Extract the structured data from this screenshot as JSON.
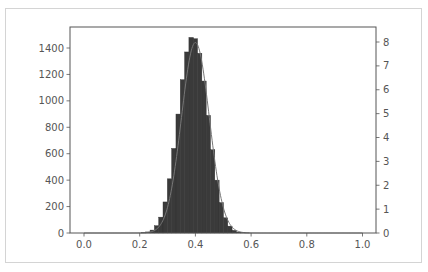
{
  "chart_data": {
    "type": "bar",
    "subtype": "histogram_with_density",
    "title": "",
    "xlabel": "",
    "ylabel": "",
    "ylabel_right": "",
    "xlim": [
      -0.05,
      1.05
    ],
    "ylim": [
      0,
      1550
    ],
    "ylim_right": [
      0,
      8.4
    ],
    "x_ticks": [
      "0.0",
      "0.2",
      "0.4",
      "0.6",
      "0.8",
      "1.0"
    ],
    "x_tick_values": [
      0.0,
      0.2,
      0.4,
      0.6,
      0.8,
      1.0
    ],
    "y_ticks_left": [
      "0",
      "200",
      "400",
      "600",
      "800",
      "1000",
      "1200",
      "1400"
    ],
    "y_tick_values_left": [
      0,
      200,
      400,
      600,
      800,
      1000,
      1200,
      1400
    ],
    "y_ticks_right": [
      "0",
      "1",
      "2",
      "3",
      "4",
      "5",
      "6",
      "7",
      "8"
    ],
    "y_tick_values_right": [
      0,
      1,
      2,
      3,
      4,
      5,
      6,
      7,
      8
    ],
    "grid": false,
    "legend": null,
    "bar_color": "#3a3a3a",
    "line_color": "#777777",
    "bin_width": 0.0155,
    "bin_left_edges": [
      0.2062,
      0.2217,
      0.2372,
      0.2527,
      0.2682,
      0.2837,
      0.2992,
      0.3147,
      0.3302,
      0.3457,
      0.3612,
      0.3767,
      0.3922,
      0.4077,
      0.4232,
      0.4387,
      0.4542,
      0.4697,
      0.4852,
      0.5007,
      0.5162,
      0.5317,
      0.5472,
      0.5627,
      0.5782
    ],
    "counts": [
      3,
      8,
      22,
      55,
      120,
      235,
      410,
      640,
      900,
      1160,
      1370,
      1480,
      1470,
      1360,
      1150,
      890,
      630,
      400,
      230,
      115,
      52,
      20,
      7,
      2,
      1
    ],
    "density_curve": {
      "distribution": "normal",
      "mean": 0.4,
      "std": 0.05,
      "peak_density": 7.98
    }
  }
}
